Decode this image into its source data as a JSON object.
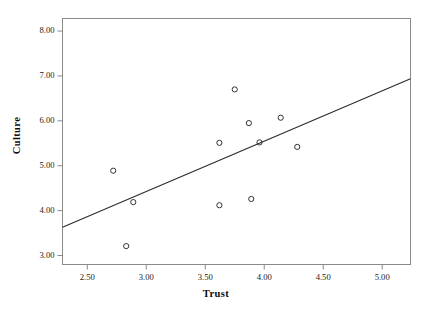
{
  "chart_data": {
    "type": "scatter",
    "title": "",
    "xlabel": "Trust",
    "ylabel": "Culture",
    "xlim": [
      2.29,
      5.24
    ],
    "ylim": [
      2.8,
      8.28
    ],
    "xticks": [
      "2.50",
      "3.00",
      "3.50",
      "4.00",
      "4.50",
      "5.00"
    ],
    "xtick_values": [
      2.5,
      3.0,
      3.5,
      4.0,
      4.5,
      5.0
    ],
    "yticks": [
      "3.00",
      "4.00",
      "5.00",
      "6.00",
      "7.00",
      "8.00"
    ],
    "ytick_values": [
      3.0,
      4.0,
      5.0,
      6.0,
      7.0,
      8.0
    ],
    "grid": false,
    "legend": false,
    "marker": "open-circle",
    "marker_color": "#333333",
    "points": [
      {
        "x": 2.72,
        "y": 4.89
      },
      {
        "x": 2.83,
        "y": 3.21
      },
      {
        "x": 2.89,
        "y": 4.19
      },
      {
        "x": 3.62,
        "y": 5.51
      },
      {
        "x": 3.62,
        "y": 4.12
      },
      {
        "x": 3.75,
        "y": 6.7
      },
      {
        "x": 3.87,
        "y": 5.95
      },
      {
        "x": 3.89,
        "y": 4.26
      },
      {
        "x": 3.96,
        "y": 5.52
      },
      {
        "x": 4.14,
        "y": 6.07
      },
      {
        "x": 4.28,
        "y": 5.42
      }
    ],
    "fit_line": {
      "name": "linear-fit",
      "color": "#2b2b2b",
      "x_start": 2.29,
      "y_start": 3.63,
      "x_end": 5.24,
      "y_end": 6.94
    },
    "frame_color": "#8a8a8a",
    "background": "#ffffff"
  }
}
